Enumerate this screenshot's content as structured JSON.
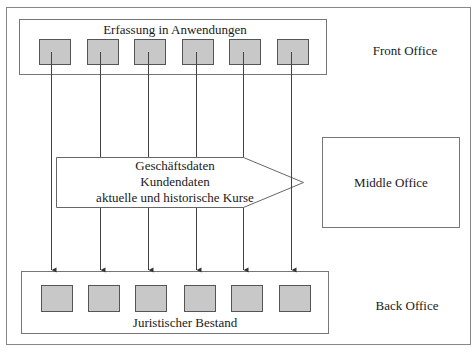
{
  "diagram": {
    "front_office": {
      "label": "Front Office",
      "box_label": "Erfassung in Anwendungen",
      "square_count": 6
    },
    "middle_office": {
      "label": "Middle Office"
    },
    "back_office": {
      "label": "Back Office",
      "box_label": "Juristischer Bestand",
      "square_count": 6
    },
    "data_arrow": {
      "lines": [
        "Geschäftsdaten",
        "Kundendaten",
        "aktuelle und historische Kurse"
      ]
    },
    "colors": {
      "square_fill": "#c8c8c8",
      "square_stroke": "#555555",
      "line_stroke": "#444444",
      "box_stroke": "#777777"
    }
  }
}
